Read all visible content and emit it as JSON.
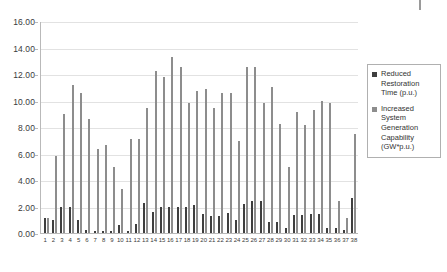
{
  "chart_data": {
    "type": "bar",
    "title": "",
    "subtitle": "",
    "xlabel": "",
    "ylabel": "",
    "ylim": [
      0.0,
      16.0
    ],
    "ytick_step": 2.0,
    "ytick_labels": [
      "16.00",
      "14.00",
      "12.00",
      "10.00",
      "8.00",
      "6.00",
      "4.00",
      "2.00",
      "0.00"
    ],
    "ytick_values": [
      16.0,
      14.0,
      12.0,
      10.0,
      8.0,
      6.0,
      4.0,
      2.0,
      0.0
    ],
    "grid": true,
    "grid_axis": "y",
    "legend_position": "right",
    "categories": [
      "1",
      "2",
      "3",
      "4",
      "5",
      "6",
      "7",
      "8",
      "9",
      "10",
      "11",
      "12",
      "13",
      "14",
      "15",
      "16",
      "17",
      "18",
      "19",
      "20",
      "21",
      "22",
      "23",
      "24",
      "25",
      "26",
      "27",
      "28",
      "29",
      "30",
      "31",
      "32",
      "33",
      "34",
      "35",
      "36",
      "37",
      "38"
    ],
    "series": [
      {
        "name": "Reduced Restoration Time (p.u.)",
        "color": "#3f3f3f",
        "values": [
          1.15,
          1.0,
          2.0,
          2.0,
          1.0,
          0.2,
          0.18,
          0.18,
          0.18,
          0.6,
          0.18,
          0.7,
          2.3,
          1.55,
          2.0,
          2.0,
          2.0,
          2.0,
          2.1,
          1.45,
          1.3,
          1.3,
          1.5,
          0.95,
          2.2,
          2.4,
          2.4,
          0.85,
          0.85,
          0.35,
          1.35,
          1.35,
          1.4,
          1.4,
          0.4,
          0.4,
          0.2,
          2.65
        ]
      },
      {
        "name": "Increased System Generation Capability (GW*p.u.)",
        "color": "#8d8d8d",
        "values": [
          1.15,
          5.85,
          8.95,
          11.2,
          10.55,
          8.6,
          6.35,
          6.65,
          4.95,
          3.35,
          7.1,
          7.1,
          9.45,
          12.2,
          11.75,
          13.3,
          12.5,
          9.8,
          10.7,
          10.9,
          9.4,
          10.6,
          10.6,
          6.95,
          12.55,
          12.55,
          9.85,
          11.05,
          8.2,
          4.95,
          9.1,
          8.15,
          9.25,
          10.0,
          9.85,
          2.45,
          1.15,
          7.45
        ]
      }
    ]
  },
  "legend": {
    "entries": [
      {
        "label": "Reduced Restoration Time (p.u.)",
        "swatch_name": "legend-swatch-reduced-restoration-time"
      },
      {
        "label": "Increased System Generation Capability (GW*p.u.)",
        "swatch_name": "legend-swatch-increased-system-generation-capability"
      }
    ]
  },
  "colors": {
    "series_0": "#3f3f3f",
    "series_1": "#8d8d8d",
    "grid": "#e2e2e2",
    "axis": "#b9b9b9",
    "background": "#ffffff",
    "text": "#333333"
  }
}
